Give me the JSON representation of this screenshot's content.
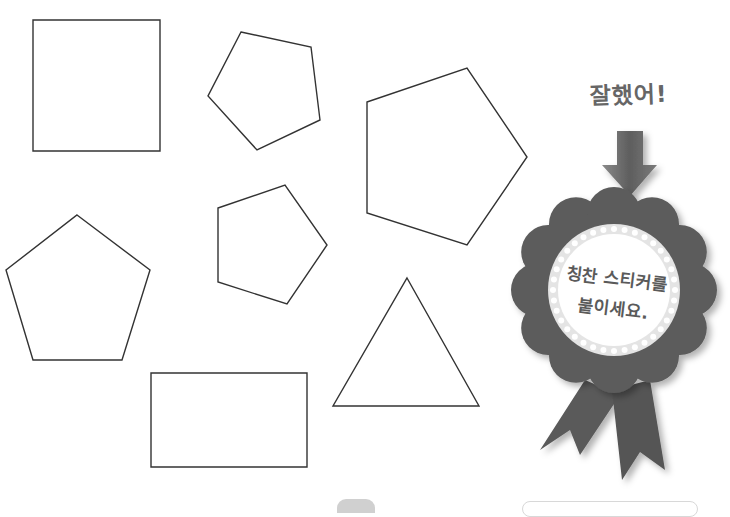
{
  "worksheet": {
    "shapes": [
      {
        "type": "square",
        "points": [
          [
            33,
            20
          ],
          [
            160,
            20
          ],
          [
            160,
            151
          ],
          [
            33,
            151
          ]
        ]
      },
      {
        "type": "pentagon",
        "points": [
          [
            241,
            32
          ],
          [
            311,
            47
          ],
          [
            320,
            120
          ],
          [
            257,
            150
          ],
          [
            208,
            96
          ]
        ]
      },
      {
        "type": "pentagon",
        "points": [
          [
            367,
            102
          ],
          [
            467,
            68
          ],
          [
            527,
            157
          ],
          [
            467,
            245
          ],
          [
            367,
            213
          ]
        ]
      },
      {
        "type": "pentagon",
        "points": [
          [
            218,
            208
          ],
          [
            285,
            185
          ],
          [
            327,
            245
          ],
          [
            287,
            304
          ],
          [
            218,
            282
          ]
        ]
      },
      {
        "type": "pentagon",
        "points": [
          [
            77,
            215
          ],
          [
            150,
            270
          ],
          [
            122,
            360
          ],
          [
            33,
            360
          ],
          [
            6,
            270
          ]
        ]
      },
      {
        "type": "triangle",
        "points": [
          [
            407,
            278
          ],
          [
            479,
            406
          ],
          [
            333,
            406
          ]
        ]
      },
      {
        "type": "rectangle",
        "points": [
          [
            151,
            373
          ],
          [
            307,
            373
          ],
          [
            307,
            467
          ],
          [
            151,
            467
          ]
        ]
      }
    ],
    "stroke_color": "#333333"
  },
  "reward": {
    "praise_text": "잘했어!",
    "arrow_icon": "down-arrow-icon",
    "sticker_line1": "칭찬 스티커를",
    "sticker_line2": "붙이세요.",
    "rosette_color": "#5c5c5c",
    "ring_color": "#e4e4e4"
  }
}
